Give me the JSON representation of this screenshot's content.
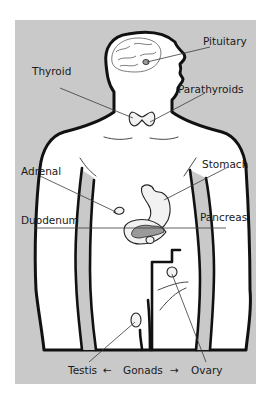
{
  "diagram": {
    "colors": {
      "background": "#ffffff",
      "panel": "#c9c9c9",
      "outline": "#111111",
      "body": "#ffffff",
      "text": "#1a1a1a"
    },
    "labels": {
      "pituitary": "Pituitary",
      "thyroid": "Thyroid",
      "parathyroids": "Parathyroids",
      "adrenal": "Adrenal",
      "stomach": "Stomach",
      "duodenum": "Duodenum",
      "pancreas": "Pancreas",
      "testis": "Testis",
      "gonads": "Gonads",
      "ovary": "Ovary"
    },
    "arrows": {
      "left": "←",
      "right": "→"
    }
  }
}
